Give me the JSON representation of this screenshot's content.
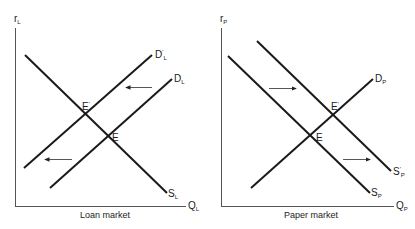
{
  "panels": [
    {
      "name": "loan-market",
      "caption": "Loan market",
      "y_axis": {
        "base": "r",
        "sub": "L"
      },
      "x_axis": {
        "base": "Q",
        "sub": "L"
      },
      "curves": [
        {
          "id": "S_L",
          "base": "S",
          "sub": "L",
          "prime": "",
          "kind": "supply"
        },
        {
          "id": "D_L",
          "base": "D",
          "sub": "L",
          "prime": "",
          "kind": "demand-original"
        },
        {
          "id": "D_L_prime",
          "base": "D",
          "sub": "L",
          "prime": "'",
          "kind": "demand-shifted"
        }
      ],
      "points": [
        {
          "label": "E",
          "prime": ""
        },
        {
          "label": "E",
          "prime": "'"
        }
      ],
      "shift": "left"
    },
    {
      "name": "paper-market",
      "caption": "Paper market",
      "y_axis": {
        "base": "r",
        "sub": "P"
      },
      "x_axis": {
        "base": "Q",
        "sub": "P"
      },
      "curves": [
        {
          "id": "D_P",
          "base": "D",
          "sub": "P",
          "prime": "",
          "kind": "demand"
        },
        {
          "id": "S_P",
          "base": "S",
          "sub": "P",
          "prime": "",
          "kind": "supply-original"
        },
        {
          "id": "S_P_prime",
          "base": "S",
          "sub": "P",
          "prime": "'",
          "kind": "supply-shifted"
        }
      ],
      "points": [
        {
          "label": "E",
          "prime": ""
        },
        {
          "label": "E",
          "prime": "'"
        }
      ],
      "shift": "right"
    }
  ],
  "colors": {
    "line": "#1a1a1a",
    "arrow": "#333333",
    "background": "#ffffff"
  }
}
